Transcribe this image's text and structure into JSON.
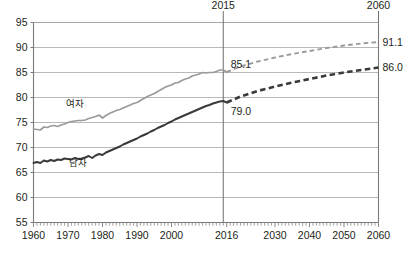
{
  "chart_data": {
    "type": "line",
    "title": "",
    "subtitle": "",
    "xlabel": "",
    "ylabel": "",
    "xlim": [
      1960,
      2060
    ],
    "ylim": [
      55,
      95
    ],
    "grid": true,
    "legend_position": "inline",
    "y_ticks": [
      "95",
      "90",
      "85",
      "80",
      "75",
      "70",
      "65",
      "60",
      "55"
    ],
    "y_tick_values": [
      95,
      90,
      85,
      80,
      75,
      70,
      65,
      60,
      55
    ],
    "x_ticks": [
      "1960",
      "1970",
      "1980",
      "1990",
      "2000",
      "2016",
      "2030",
      "2040",
      "2050",
      "2060"
    ],
    "x_tick_values": [
      1960,
      1970,
      1980,
      1990,
      2000,
      2016,
      2030,
      2040,
      2050,
      2060
    ],
    "top_axis_labels": [
      {
        "text": "2015",
        "value": 2015
      },
      {
        "text": "2060",
        "value": 2060
      }
    ],
    "right_axis_labels": [
      {
        "text": "91.1",
        "value": 91.1
      },
      {
        "text": "86.0",
        "value": 86.0
      }
    ],
    "annotations": [
      {
        "text": "85.1",
        "x": 2016,
        "y": 85.1
      },
      {
        "text": "79.0",
        "x": 2016,
        "y": 79.0
      }
    ],
    "divider_year": 2015,
    "series": [
      {
        "name": "여자",
        "label": "여자",
        "color": "#9a9a9a",
        "label_x": 1972,
        "label_y": 78.2,
        "observed": {
          "x": [
            1960,
            1961,
            1962,
            1963,
            1964,
            1965,
            1966,
            1967,
            1968,
            1969,
            1970,
            1971,
            1972,
            1973,
            1974,
            1975,
            1976,
            1977,
            1978,
            1979,
            1980,
            1981,
            1982,
            1983,
            1984,
            1985,
            1986,
            1987,
            1988,
            1989,
            1990,
            1991,
            1992,
            1993,
            1994,
            1995,
            1996,
            1997,
            1998,
            1999,
            2000,
            2001,
            2002,
            2003,
            2004,
            2005,
            2006,
            2007,
            2008,
            2009,
            2010,
            2011,
            2012,
            2013,
            2014,
            2015,
            2016
          ],
          "y": [
            73.7,
            73.6,
            73.5,
            74.1,
            74.0,
            74.3,
            74.4,
            74.2,
            74.5,
            74.7,
            75.0,
            75.2,
            75.3,
            75.4,
            75.4,
            75.5,
            75.8,
            76.0,
            76.2,
            76.5,
            75.9,
            76.4,
            76.8,
            77.1,
            77.4,
            77.6,
            77.9,
            78.2,
            78.5,
            78.8,
            79.0,
            79.4,
            79.8,
            80.2,
            80.5,
            80.8,
            81.2,
            81.6,
            82.0,
            82.3,
            82.5,
            82.9,
            83.0,
            83.4,
            83.7,
            83.9,
            84.3,
            84.5,
            84.7,
            85.0,
            84.9,
            85.0,
            85.0,
            85.2,
            85.5,
            85.5,
            85.1
          ]
        },
        "projected": {
          "x": [
            2016,
            2020,
            2025,
            2030,
            2035,
            2040,
            2045,
            2050,
            2055,
            2060
          ],
          "y": [
            85.1,
            86.2,
            87.2,
            88.0,
            88.7,
            89.3,
            89.9,
            90.4,
            90.8,
            91.1
          ]
        },
        "end_value": 91.1,
        "value_2015": 85.1,
        "style_observed": "solid",
        "style_projected": "dashed"
      },
      {
        "name": "남자",
        "label": "남자",
        "color": "#3a3a3a",
        "label_x": 1973,
        "label_y": 66.3,
        "observed": {
          "x": [
            1960,
            1961,
            1962,
            1963,
            1964,
            1965,
            1966,
            1967,
            1968,
            1969,
            1970,
            1971,
            1972,
            1973,
            1974,
            1975,
            1976,
            1977,
            1978,
            1979,
            1980,
            1981,
            1982,
            1983,
            1984,
            1985,
            1986,
            1987,
            1988,
            1989,
            1990,
            1991,
            1992,
            1993,
            1994,
            1995,
            1996,
            1997,
            1998,
            1999,
            2000,
            2001,
            2002,
            2003,
            2004,
            2005,
            2006,
            2007,
            2008,
            2009,
            2010,
            2011,
            2012,
            2013,
            2014,
            2015,
            2016
          ],
          "y": [
            66.9,
            67.1,
            66.9,
            67.4,
            67.2,
            67.5,
            67.3,
            67.6,
            67.5,
            67.8,
            67.7,
            67.6,
            67.9,
            67.7,
            67.8,
            68.0,
            68.3,
            67.9,
            68.4,
            68.7,
            68.5,
            69.0,
            69.3,
            69.6,
            69.9,
            70.2,
            70.6,
            70.9,
            71.2,
            71.5,
            71.8,
            72.2,
            72.5,
            72.8,
            73.2,
            73.5,
            73.9,
            74.2,
            74.5,
            74.9,
            75.2,
            75.6,
            75.9,
            76.2,
            76.5,
            76.8,
            77.1,
            77.4,
            77.7,
            78.0,
            78.3,
            78.5,
            78.8,
            79.0,
            79.2,
            79.3,
            79.0
          ]
        },
        "projected": {
          "x": [
            2016,
            2020,
            2025,
            2030,
            2035,
            2040,
            2045,
            2050,
            2055,
            2060
          ],
          "y": [
            79.0,
            80.2,
            81.3,
            82.2,
            83.0,
            83.7,
            84.4,
            85.0,
            85.5,
            86.0
          ]
        },
        "end_value": 86.0,
        "value_2015": 79.0,
        "style_observed": "solid",
        "style_projected": "dashed"
      }
    ]
  }
}
